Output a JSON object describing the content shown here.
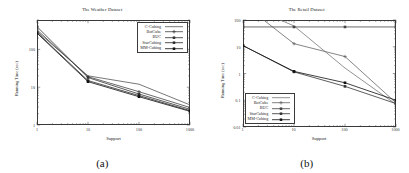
{
  "figure": {
    "panels": [
      {
        "sub_caption": "(a)",
        "title": "The Weather Dataset",
        "xlabel": "Support",
        "ylabel": "Running Time (sec)"
      },
      {
        "sub_caption": "(b)",
        "title": "The Retail Dataset",
        "xlabel": "Support",
        "ylabel": "Running Time (sec)"
      }
    ]
  },
  "chart_data": [
    {
      "type": "line",
      "title": "The Weather Dataset",
      "xlabel": "Support",
      "ylabel": "Running Time (sec)",
      "xscale": "log",
      "yscale": "log",
      "xlim": [
        1,
        1000
      ],
      "ylim": [
        1,
        600
      ],
      "xticks": [
        1,
        10,
        100,
        1000
      ],
      "xtick_labels": [
        "1",
        "10",
        "100",
        "1000"
      ],
      "yticks": [
        1,
        10,
        100
      ],
      "ytick_labels": [
        "1",
        "10",
        "100"
      ],
      "grid": false,
      "legend_position": "top-right",
      "x": [
        1,
        10,
        100,
        1000
      ],
      "series": [
        {
          "name": "C-Cubing",
          "marker": "line",
          "color": "#555555",
          "values": [
            300,
            20,
            12,
            3.4
          ]
        },
        {
          "name": "BotCube",
          "marker": "cross",
          "color": "#444444",
          "values": [
            330,
            19,
            7.6,
            2.9
          ]
        },
        {
          "name": "BUC",
          "marker": "square",
          "color": "#333333",
          "values": [
            400,
            18,
            6.6,
            2.6
          ]
        },
        {
          "name": "StarCubing",
          "marker": "square",
          "color": "#2a2a2a",
          "values": [
            280,
            15,
            6.0,
            2.4
          ]
        },
        {
          "name": "MM-Cubing",
          "marker": "square",
          "color": "#111111",
          "values": [
            270,
            14,
            5.6,
            2.3
          ]
        }
      ]
    },
    {
      "type": "line",
      "title": "The Retail Dataset",
      "xlabel": "Support",
      "ylabel": "Running Time (sec)",
      "xscale": "log",
      "yscale": "log",
      "xlim": [
        1,
        1000
      ],
      "ylim": [
        0.01,
        100
      ],
      "xticks": [
        1,
        10,
        100,
        1000
      ],
      "xtick_labels": [
        "1",
        "10",
        "100",
        "1000"
      ],
      "yticks": [
        0.01,
        0.1,
        1,
        10,
        100
      ],
      "ytick_labels": [
        "0.01",
        "0.1",
        "1",
        "10",
        "100"
      ],
      "grid": false,
      "legend_position": "bottom-left",
      "x": [
        1,
        10,
        100,
        1000
      ],
      "series": [
        {
          "name": "C-Cubing",
          "marker": "line",
          "color": "#777777",
          "values": [
            600,
            60,
            1.6,
            0.07
          ]
        },
        {
          "name": "BotCube",
          "marker": "cross",
          "color": "#666666",
          "values": [
            900,
            13,
            4.3,
            0.08
          ]
        },
        {
          "name": "BUC",
          "marker": "square",
          "color": "#444444",
          "values": [
            55,
            55,
            55,
            55
          ]
        },
        {
          "name": "StarCubing",
          "marker": "square",
          "color": "#333333",
          "values": [
            11,
            1.15,
            0.33,
            0.075
          ]
        },
        {
          "name": "MM-Cubing",
          "marker": "square",
          "color": "#111111",
          "values": [
            11,
            1.2,
            0.45,
            0.1
          ]
        }
      ]
    }
  ]
}
